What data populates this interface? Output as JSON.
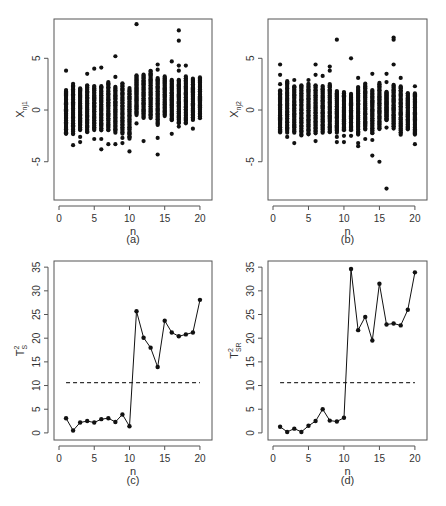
{
  "figure": {
    "panels": [
      {
        "id": "a",
        "caption": "(a)",
        "xlabel": "n",
        "ylabel_main": "X",
        "ylabel_sub": "nj1"
      },
      {
        "id": "b",
        "caption": "(b)",
        "xlabel": "n",
        "ylabel_main": "X",
        "ylabel_sub": "nj2"
      },
      {
        "id": "c",
        "caption": "(c)",
        "xlabel": "n",
        "ylabel_main": "T",
        "ylabel_sup": "2",
        "ylabel_sub": "S"
      },
      {
        "id": "d",
        "caption": "(d)",
        "xlabel": "n",
        "ylabel_main": "T",
        "ylabel_sup": "2",
        "ylabel_sub": "SR"
      }
    ]
  },
  "chart_data": [
    {
      "panel": "a",
      "type": "scatter",
      "title": "",
      "xlabel": "n",
      "ylabel": "X_nj1",
      "caption": "(a)",
      "xlim": [
        0,
        21
      ],
      "ylim": [
        -8.7,
        8.8
      ],
      "xticks": [
        0,
        5,
        10,
        15,
        20
      ],
      "yticks": [
        -5,
        0,
        5
      ],
      "grid": false,
      "column_ranges": [
        {
          "n": 1,
          "low": -2.3,
          "high": 2.0,
          "outliers": [
            3.8,
            -1.8,
            -2.3
          ]
        },
        {
          "n": 2,
          "low": -2.4,
          "high": 2.6,
          "outliers": [
            -3.4
          ]
        },
        {
          "n": 3,
          "low": -2.0,
          "high": 2.2,
          "outliers": [
            -2.6,
            -3.1
          ]
        },
        {
          "n": 4,
          "low": -2.2,
          "high": 2.5,
          "outliers": [
            3.5
          ]
        },
        {
          "n": 5,
          "low": -2.0,
          "high": 2.4,
          "outliers": [
            4.0,
            -2.8
          ]
        },
        {
          "n": 6,
          "low": -2.0,
          "high": 2.4,
          "outliers": [
            4.1,
            -2.8,
            -3.8
          ]
        },
        {
          "n": 7,
          "low": -2.0,
          "high": 2.8,
          "outliers": [
            -3.3
          ]
        },
        {
          "n": 8,
          "low": -2.2,
          "high": 2.3,
          "outliers": [
            5.2,
            3.2,
            -3.3
          ]
        },
        {
          "n": 9,
          "low": -2.3,
          "high": 2.7,
          "outliers": [
            -2.7,
            -3.2
          ]
        },
        {
          "n": 10,
          "low": -2.8,
          "high": 2.2,
          "outliers": [
            -4.0
          ]
        },
        {
          "n": 11,
          "low": -0.5,
          "high": 3.4,
          "outliers": [
            8.3,
            -1.3
          ]
        },
        {
          "n": 12,
          "low": -0.8,
          "high": 3.5,
          "outliers": [
            -3.0
          ]
        },
        {
          "n": 13,
          "low": -0.8,
          "high": 3.9,
          "outliers": []
        },
        {
          "n": 14,
          "low": -1.5,
          "high": 3.2,
          "outliers": [
            4.4,
            3.9,
            -2.7,
            -4.3
          ]
        },
        {
          "n": 15,
          "low": -0.6,
          "high": 3.3,
          "outliers": []
        },
        {
          "n": 16,
          "low": -1.0,
          "high": 3.0,
          "outliers": [
            4.7,
            -2.3
          ]
        },
        {
          "n": 17,
          "low": -1.3,
          "high": 3.0,
          "outliers": [
            7.7,
            6.7,
            4.3,
            3.8,
            -1.6
          ]
        },
        {
          "n": 18,
          "low": -1.3,
          "high": 3.3,
          "outliers": [
            4.3
          ]
        },
        {
          "n": 19,
          "low": -1.0,
          "high": 3.1,
          "outliers": [
            -1.8
          ]
        },
        {
          "n": 20,
          "low": -0.8,
          "high": 3.2,
          "outliers": []
        }
      ]
    },
    {
      "panel": "b",
      "type": "scatter",
      "title": "",
      "xlabel": "n",
      "ylabel": "X_nj2",
      "caption": "(b)",
      "xlim": [
        0,
        21
      ],
      "ylim": [
        -8.7,
        8.8
      ],
      "xticks": [
        0,
        5,
        10,
        15,
        20
      ],
      "yticks": [
        -5,
        0,
        5
      ],
      "grid": false,
      "column_ranges": [
        {
          "n": 1,
          "low": -2.2,
          "high": 2.0,
          "outliers": [
            4.4,
            3.4,
            2.5
          ]
        },
        {
          "n": 2,
          "low": -2.2,
          "high": 2.9,
          "outliers": [
            -2.6
          ]
        },
        {
          "n": 3,
          "low": -2.2,
          "high": 2.4,
          "outliers": [
            2.9,
            -3.2
          ]
        },
        {
          "n": 4,
          "low": -2.5,
          "high": 2.5,
          "outliers": []
        },
        {
          "n": 5,
          "low": -2.4,
          "high": 2.6,
          "outliers": [
            2.9
          ]
        },
        {
          "n": 6,
          "low": -2.3,
          "high": 2.5,
          "outliers": [
            4.4,
            3.4,
            -3.0
          ]
        },
        {
          "n": 7,
          "low": -2.2,
          "high": 2.4,
          "outliers": [
            3.3
          ]
        },
        {
          "n": 8,
          "low": -2.2,
          "high": 2.6,
          "outliers": [
            4.2,
            3.8
          ]
        },
        {
          "n": 9,
          "low": -2.2,
          "high": 1.9,
          "outliers": [
            6.8,
            -3.1,
            -2.6
          ]
        },
        {
          "n": 10,
          "low": -2.0,
          "high": 1.8,
          "outliers": [
            -2.5,
            -3.1
          ]
        },
        {
          "n": 11,
          "low": -2.0,
          "high": 1.6,
          "outliers": [
            5.0,
            -2.5
          ]
        },
        {
          "n": 12,
          "low": -2.4,
          "high": 2.3,
          "outliers": [
            3.1,
            -3.2,
            -3.5
          ]
        },
        {
          "n": 13,
          "low": -1.9,
          "high": 2.6,
          "outliers": [
            -2.8
          ]
        },
        {
          "n": 14,
          "low": -2.3,
          "high": 2.0,
          "outliers": [
            3.5,
            -2.9,
            -4.4
          ]
        },
        {
          "n": 15,
          "low": -1.9,
          "high": 2.7,
          "outliers": [
            -5.0
          ]
        },
        {
          "n": 16,
          "low": -1.0,
          "high": 1.8,
          "outliers": [
            3.5,
            2.7,
            -1.7,
            -7.6
          ]
        },
        {
          "n": 17,
          "low": -1.8,
          "high": 2.5,
          "outliers": [
            7.0,
            6.8,
            4.4
          ]
        },
        {
          "n": 18,
          "low": -2.4,
          "high": 2.4,
          "outliers": [
            3.1
          ]
        },
        {
          "n": 19,
          "low": -1.9,
          "high": 1.7,
          "outliers": []
        },
        {
          "n": 20,
          "low": -2.4,
          "high": 1.7,
          "outliers": [
            2.3,
            -3.3
          ]
        }
      ]
    },
    {
      "panel": "c",
      "type": "line",
      "title": "",
      "xlabel": "n",
      "ylabel": "T^2_S",
      "caption": "(c)",
      "xlim": [
        0,
        21
      ],
      "ylim": [
        -1.5,
        36.3
      ],
      "xticks": [
        0,
        5,
        10,
        15,
        20
      ],
      "yticks": [
        0,
        5,
        10,
        15,
        20,
        25,
        30,
        35
      ],
      "grid": false,
      "x": [
        1,
        2,
        3,
        4,
        5,
        6,
        7,
        8,
        9,
        10,
        11,
        12,
        13,
        14,
        15,
        16,
        17,
        18,
        19,
        20
      ],
      "values": [
        3.1,
        0.5,
        2.2,
        2.5,
        2.2,
        2.9,
        3.1,
        2.3,
        3.9,
        1.4,
        25.7,
        20.1,
        18.0,
        13.9,
        23.7,
        21.2,
        20.4,
        20.8,
        21.2,
        28.1
      ],
      "control_limit": {
        "value": 10.6,
        "style": "dashed",
        "x_range": [
          1,
          20
        ]
      }
    },
    {
      "panel": "d",
      "type": "line",
      "title": "",
      "xlabel": "n",
      "ylabel": "T^2_SR",
      "caption": "(d)",
      "xlim": [
        0,
        21
      ],
      "ylim": [
        -1.5,
        36.3
      ],
      "xticks": [
        0,
        5,
        10,
        15,
        20
      ],
      "yticks": [
        0,
        5,
        10,
        15,
        20,
        25,
        30,
        35
      ],
      "grid": false,
      "x": [
        1,
        2,
        3,
        4,
        5,
        6,
        7,
        8,
        9,
        10,
        11,
        12,
        13,
        14,
        15,
        16,
        17,
        18,
        19,
        20
      ],
      "values": [
        1.3,
        0.2,
        0.9,
        0.2,
        1.5,
        2.5,
        5.0,
        2.6,
        2.4,
        3.2,
        34.6,
        21.7,
        24.5,
        19.5,
        31.5,
        22.9,
        23.1,
        22.7,
        26.0,
        33.9
      ],
      "control_limit": {
        "value": 10.6,
        "style": "dashed",
        "x_range": [
          1,
          20
        ]
      }
    }
  ]
}
